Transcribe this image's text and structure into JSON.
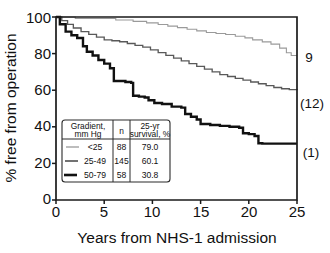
{
  "chart_data": {
    "type": "line",
    "title": "",
    "xlabel": "Years from NHS-1 admission",
    "ylabel": "% free from operation",
    "xlim": [
      0,
      25
    ],
    "ylim": [
      0,
      100
    ],
    "xticks": [
      0,
      5,
      10,
      15,
      20,
      25
    ],
    "yticks": [
      0,
      20,
      40,
      60,
      80,
      100
    ],
    "grid": false,
    "legend_position": "inset-lower-left",
    "step_style": "post",
    "series": [
      {
        "name": "<25",
        "gradient_mm_hg": "<25",
        "n": 88,
        "survival_25yr_pct": 79.0,
        "color": "#9a9a9a",
        "line_width": 1.1,
        "end_label": "9",
        "x": [
          0,
          1.2,
          2.0,
          3.4,
          6.2,
          8.0,
          9.4,
          10.6,
          11.6,
          12.6,
          13.6,
          14.6,
          15.6,
          16.6,
          17.6,
          18.6,
          19.6,
          20.4,
          21.4,
          22.3,
          23.2,
          23.9,
          24.4,
          25.0
        ],
        "y": [
          100,
          100,
          99.2,
          99.2,
          98.4,
          97.6,
          96.8,
          95.9,
          95.0,
          94.2,
          93.3,
          92.4,
          91.5,
          91.0,
          90.4,
          89.5,
          88.6,
          87.5,
          86.4,
          85.2,
          83.0,
          80.5,
          79.0,
          79.0
        ]
      },
      {
        "name": "25-49",
        "gradient_mm_hg": "25-49",
        "n": 145,
        "survival_25yr_pct": 60.1,
        "color": "#595959",
        "line_width": 1.35,
        "end_label": "(12)",
        "x": [
          0,
          0.6,
          1.2,
          1.8,
          2.6,
          3.4,
          4.2,
          5.0,
          5.8,
          6.6,
          7.4,
          8.2,
          9.0,
          9.8,
          10.6,
          11.4,
          12.2,
          13.0,
          13.8,
          14.6,
          15.4,
          16.2,
          17.0,
          17.8,
          18.6,
          19.4,
          20.2,
          21.0,
          21.8,
          22.6,
          23.4,
          24.2,
          25.0
        ],
        "y": [
          100,
          98.0,
          96.0,
          94.0,
          92.0,
          90.5,
          89.0,
          87.5,
          87.0,
          86.5,
          85.5,
          84.5,
          83.5,
          82.0,
          80.5,
          79.0,
          77.5,
          76.0,
          74.5,
          73.0,
          71.5,
          70.0,
          68.5,
          67.5,
          66.5,
          65.5,
          64.5,
          63.5,
          62.5,
          61.5,
          60.8,
          60.3,
          60.1
        ]
      },
      {
        "name": "50-79",
        "gradient_mm_hg": "50-79",
        "n": 58,
        "survival_25yr_pct": 30.8,
        "color": "#111111",
        "line_width": 2.4,
        "end_label": "(1)",
        "x": [
          0,
          0.4,
          1.0,
          1.6,
          2.2,
          2.8,
          3.2,
          3.8,
          4.4,
          5.0,
          5.6,
          6.0,
          6.6,
          7.2,
          7.8,
          8.0,
          8.6,
          9.2,
          9.6,
          10.2,
          11.0,
          12.0,
          13.0,
          13.4,
          14.0,
          14.6,
          15.0,
          16.0,
          17.0,
          18.0,
          19.0,
          19.4,
          20.0,
          20.6,
          21.0,
          21.4,
          22.0,
          23.0,
          24.0,
          25.0
        ],
        "y": [
          100,
          96.0,
          92.0,
          90.0,
          88.5,
          84.0,
          81.0,
          79.0,
          76.5,
          74.5,
          72.0,
          65.0,
          65.0,
          64.5,
          64.0,
          57.0,
          56.5,
          56.0,
          54.5,
          53.0,
          52.5,
          51.0,
          50.5,
          47.0,
          45.5,
          44.0,
          41.5,
          41.0,
          40.5,
          40.0,
          39.5,
          36.5,
          36.0,
          35.0,
          31.0,
          30.8,
          30.8,
          30.8,
          30.8,
          30.8
        ]
      }
    ]
  },
  "legend": {
    "headers": [
      "Gradient,\nmm Hg",
      "n",
      "25-yr\nsurvival, %"
    ],
    "header_gradient_line1": "Gradient,",
    "header_gradient_line2": "mm Hg",
    "header_n": "n",
    "header_surv_line1": "25-yr",
    "header_surv_line2": "survival, %",
    "rows": [
      {
        "gradient": "<25",
        "n": "88",
        "survival": "79.0"
      },
      {
        "gradient": "25-49",
        "n": "145",
        "survival": "60.1"
      },
      {
        "gradient": "50-79",
        "n": "58",
        "survival": "30.8"
      }
    ]
  },
  "axes": {
    "y_title": "% free from operation",
    "x_title": "Years from NHS-1 admission",
    "y_tick_labels": [
      "0",
      "20",
      "40",
      "60",
      "80",
      "100"
    ],
    "x_tick_labels": [
      "0",
      "5",
      "10",
      "15",
      "20",
      "25"
    ]
  },
  "end_labels": [
    {
      "text": "9",
      "series": "<25"
    },
    {
      "text": "(12)",
      "series": "25-49"
    },
    {
      "text": "(1)",
      "series": "50-79"
    }
  ]
}
